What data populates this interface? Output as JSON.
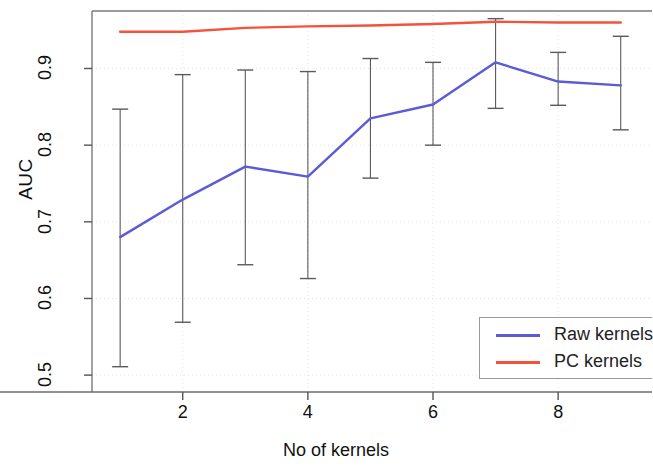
{
  "chart_data": {
    "type": "line",
    "title": "",
    "xlabel": "No of kernels",
    "ylabel": "AUC",
    "xlim": [
      0.55,
      9.5
    ],
    "ylim": [
      0.478,
      0.975
    ],
    "xticks": [
      2,
      4,
      6,
      8
    ],
    "xtick_labels": [
      "2",
      "4",
      "6",
      "8"
    ],
    "yticks": [
      0.5,
      0.6,
      0.7,
      0.8,
      0.9
    ],
    "ytick_labels": [
      "0.5",
      "0.6",
      "0.7",
      "0.8",
      "0.9"
    ],
    "grid": true,
    "legend_position": "bottom-right",
    "x": [
      1,
      2,
      3,
      4,
      5,
      6,
      7,
      8,
      9
    ],
    "series": [
      {
        "name": "Raw kernels",
        "color": "#5b5bd6",
        "values": [
          0.68,
          0.729,
          0.772,
          0.759,
          0.835,
          0.853,
          0.908,
          0.883,
          0.878
        ],
        "error_upper": [
          0.847,
          0.892,
          0.898,
          0.896,
          0.913,
          0.908,
          0.965,
          0.921,
          0.942
        ],
        "error_lower": [
          0.511,
          0.569,
          0.644,
          0.626,
          0.757,
          0.8,
          0.848,
          0.852,
          0.82
        ],
        "has_error_bars": true
      },
      {
        "name": "PC kernels",
        "color": "#f4533b",
        "values": [
          0.948,
          0.948,
          0.953,
          0.955,
          0.956,
          0.958,
          0.961,
          0.96,
          0.96
        ],
        "has_error_bars": false
      }
    ]
  },
  "legend": {
    "entries": [
      {
        "label": "Raw kernels",
        "color": "#5b5bd6"
      },
      {
        "label": "PC kernels",
        "color": "#f4533b"
      }
    ]
  },
  "axes": {
    "y_title": "AUC",
    "x_title": "No of kernels"
  }
}
